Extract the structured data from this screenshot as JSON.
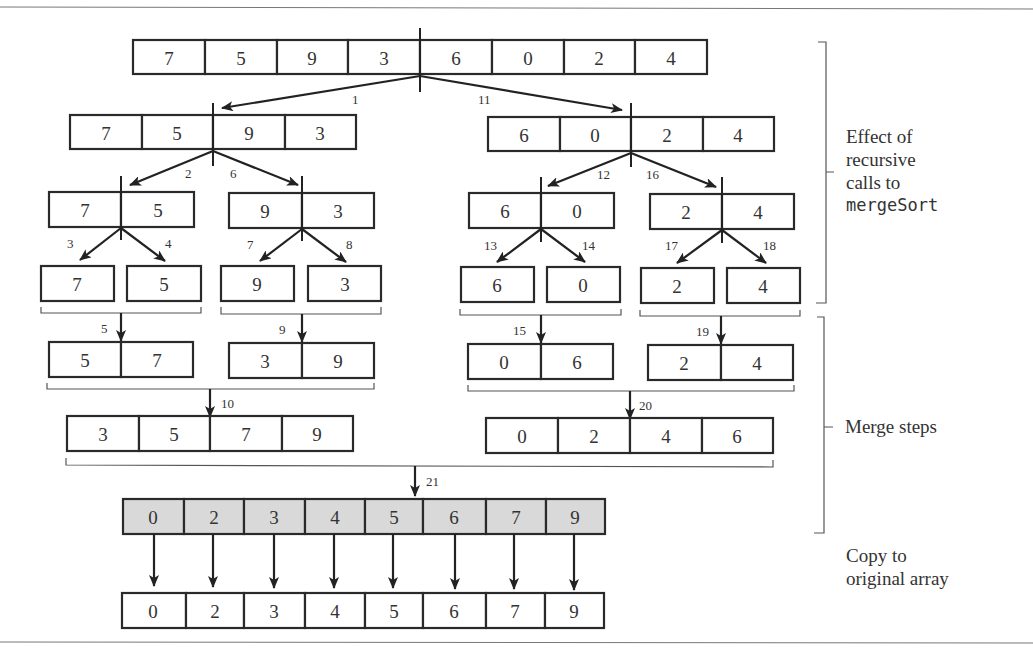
{
  "diagram": {
    "levels": {
      "original": [
        7,
        5,
        9,
        3,
        6,
        0,
        2,
        4
      ],
      "split_level_1": {
        "left": [
          7,
          5,
          9,
          3
        ],
        "right": [
          6,
          0,
          2,
          4
        ]
      },
      "split_level_2": [
        [
          7,
          5
        ],
        [
          9,
          3
        ],
        [
          6,
          0
        ],
        [
          2,
          4
        ]
      ],
      "singletons": [
        [
          7
        ],
        [
          5
        ],
        [
          9
        ],
        [
          3
        ],
        [
          6
        ],
        [
          0
        ],
        [
          2
        ],
        [
          4
        ]
      ],
      "merge_level_1": [
        [
          5,
          7
        ],
        [
          3,
          9
        ],
        [
          0,
          6
        ],
        [
          2,
          4
        ]
      ],
      "merge_level_2": [
        [
          3,
          5,
          7,
          9
        ],
        [
          0,
          2,
          4,
          6
        ]
      ],
      "temp_array": [
        0,
        2,
        3,
        4,
        5,
        6,
        7,
        9
      ],
      "final_array": [
        0,
        2,
        3,
        4,
        5,
        6,
        7,
        9
      ]
    },
    "step_labels": {
      "s1": "1",
      "s2": "2",
      "s3": "3",
      "s4": "4",
      "s5": "5",
      "s6": "6",
      "s7": "7",
      "s8": "8",
      "s9": "9",
      "s10": "10",
      "s11": "11",
      "s12": "12",
      "s13": "13",
      "s14": "14",
      "s15": "15",
      "s16": "16",
      "s17": "17",
      "s18": "18",
      "s19": "19",
      "s20": "20",
      "s21": "21"
    },
    "side_labels": {
      "recursive_line1": "Effect of",
      "recursive_line2": "recursive",
      "recursive_line3": "calls to",
      "recursive_code": "mergeSort",
      "merge": "Merge steps",
      "copy_line1": "Copy to",
      "copy_line2": "original array"
    },
    "colors": {
      "stroke": "#2a2a2a",
      "shaded_fill": "#d9d9d9",
      "text": "#333333"
    }
  }
}
